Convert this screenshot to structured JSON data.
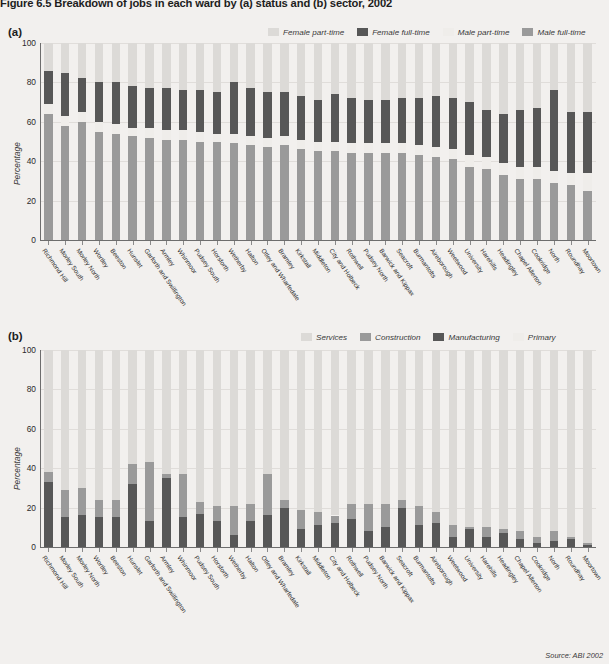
{
  "figure": {
    "title": "Figure 6.5  Breakdown of jobs in each ward by (a) status and (b) sector, 2002",
    "source": "Source: ABI 2002"
  },
  "panel_a": {
    "label": "(a)",
    "ylabel": "Percentage"
  },
  "panel_b": {
    "label": "(b)",
    "ylabel": "Percentage"
  },
  "colors": {
    "female_part_time": "#dcdad7",
    "female_full_time": "#575757",
    "male_part_time": "#efedea",
    "male_full_time": "#9a9a9a",
    "services": "#dcdad7",
    "construction": "#9a9a9a",
    "manufacturing": "#575757",
    "primary": "#efedea",
    "background": "#f2f0ee",
    "axis": "#6d6d6d"
  },
  "chart_data": [
    {
      "type": "bar",
      "title": "(a) Breakdown of jobs in each ward by status, 2002",
      "stacked": true,
      "xlabel": "",
      "ylabel": "Percentage",
      "ylim": [
        0,
        100
      ],
      "yticks": [
        "0",
        "20",
        "40",
        "60",
        "80",
        "100"
      ],
      "grid": false,
      "legend_position": "top-right",
      "legend": [
        "Female part-time",
        "Female full-time",
        "Male part-time",
        "Male full-time"
      ],
      "categories": [
        "Richmond Hill",
        "Morley South",
        "Morley North",
        "Wortley",
        "Beeston",
        "Hunslet",
        "Garforth and Swillington",
        "Armley",
        "Whinmoor",
        "Pudsey South",
        "Horsforth",
        "Wetherby",
        "Halton",
        "Otley and Wharfedale",
        "Bramley",
        "Kirkstall",
        "Middleton",
        "City and Holbeck",
        "Rothwell",
        "Pudsey North",
        "Barwick and Kippax",
        "Seacroft",
        "Burmantofts",
        "Aireborough",
        "Weetwood",
        "University",
        "Harehills",
        "Headingley",
        "Chapel Allerton",
        "Cookridge",
        "North",
        "Roundhay",
        "Moortown"
      ],
      "series": [
        {
          "name": "Male full-time",
          "values": [
            64,
            58,
            60,
            55,
            54,
            53,
            52,
            51,
            51,
            50,
            50,
            49,
            48,
            47,
            48,
            46,
            45,
            45,
            44,
            44,
            44,
            44,
            43,
            42,
            41,
            37,
            36,
            33,
            31,
            31,
            29,
            28,
            25
          ]
        },
        {
          "name": "Male part-time",
          "values": [
            5,
            5,
            5,
            5,
            5,
            4,
            5,
            5,
            5,
            5,
            4,
            5,
            5,
            5,
            5,
            5,
            5,
            5,
            5,
            5,
            5,
            5,
            5,
            5,
            5,
            6,
            6,
            6,
            6,
            6,
            6,
            6,
            9
          ]
        },
        {
          "name": "Female full-time",
          "values": [
            17,
            22,
            17,
            20,
            21,
            21,
            20,
            21,
            20,
            21,
            21,
            26,
            24,
            23,
            22,
            22,
            21,
            24,
            23,
            22,
            22,
            23,
            24,
            26,
            26,
            27,
            24,
            25,
            29,
            30,
            41,
            31,
            31
          ]
        },
        {
          "name": "Female part-time",
          "values": [
            14,
            15,
            18,
            20,
            20,
            22,
            23,
            23,
            24,
            24,
            25,
            20,
            23,
            25,
            25,
            27,
            29,
            26,
            28,
            29,
            29,
            28,
            28,
            27,
            28,
            30,
            34,
            36,
            34,
            33,
            24,
            35,
            35
          ]
        }
      ]
    },
    {
      "type": "bar",
      "title": "(b) Breakdown of jobs in each ward by sector, 2002",
      "stacked": true,
      "xlabel": "",
      "ylabel": "Percentage",
      "ylim": [
        0,
        100
      ],
      "yticks": [
        "0",
        "20",
        "40",
        "60",
        "80",
        "100"
      ],
      "grid": false,
      "legend_position": "top-right",
      "legend": [
        "Services",
        "Construction",
        "Manufacturing",
        "Primary"
      ],
      "categories": [
        "Richmond Hill",
        "Morley South",
        "Morley North",
        "Wortley",
        "Beeston",
        "Hunslet",
        "Garforth and Swillington",
        "Armley",
        "Whinmoor",
        "Pudsey South",
        "Horsforth",
        "Wetherby",
        "Halton",
        "Otley and Wharfedale",
        "Bramley",
        "Kirkstall",
        "Middleton",
        "City and Holbeck",
        "Rothwell",
        "Pudsey North",
        "Barwick and Kippax",
        "Seacroft",
        "Burmantofts",
        "Aireborough",
        "Weetwood",
        "University",
        "Harehills",
        "Headingley",
        "Chapel Allerton",
        "Cookridge",
        "North",
        "Roundhay",
        "Moortown"
      ],
      "series": [
        {
          "name": "Manufacturing",
          "values": [
            33,
            15,
            16,
            15,
            15,
            32,
            13,
            35,
            15,
            17,
            13,
            6,
            13,
            16,
            20,
            9,
            11,
            12,
            14,
            8,
            10,
            20,
            11,
            12,
            5,
            9,
            5,
            7,
            4,
            2,
            3,
            4,
            1
          ]
        },
        {
          "name": "Construction",
          "values": [
            5,
            14,
            14,
            9,
            9,
            10,
            30,
            2,
            22,
            6,
            8,
            15,
            9,
            21,
            4,
            10,
            7,
            4,
            8,
            14,
            12,
            4,
            10,
            6,
            6,
            1,
            5,
            2,
            4,
            3,
            5,
            1,
            1
          ]
        },
        {
          "name": "Services",
          "values": [
            62,
            71,
            70,
            76,
            76,
            58,
            57,
            63,
            63,
            77,
            79,
            79,
            78,
            63,
            76,
            81,
            82,
            84,
            78,
            78,
            78,
            76,
            79,
            82,
            89,
            90,
            90,
            91,
            92,
            95,
            92,
            95,
            98
          ]
        }
      ]
    }
  ]
}
